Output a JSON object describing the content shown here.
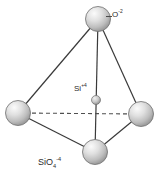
{
  "diagram": {
    "background_color": "#ffffff",
    "labels": {
      "oxygen": {
        "element": "O",
        "charge": "-2",
        "full": "O-2"
      },
      "silicon": {
        "element": "Si",
        "charge": "+4",
        "full": "Si+4"
      },
      "formula": {
        "element": "SiO",
        "subscript": "4",
        "charge": "-4",
        "full": "SiO4-4"
      }
    },
    "colors": {
      "sphere_fill_light": "#f2f2f2",
      "sphere_fill_mid": "#cfcfcf",
      "sphere_fill_dark": "#9a9a9a",
      "sphere_outline": "#6e6e6e",
      "bond_line": "#3a3a3a",
      "hidden_bond_line": "#4f4f4f",
      "text": "#2b2b2b"
    },
    "atoms": [
      {
        "id": "o-top",
        "element": "O",
        "cx": 98,
        "cy": 19,
        "r": 12.5,
        "role": "vertex"
      },
      {
        "id": "o-left",
        "element": "O",
        "cx": 18,
        "cy": 113,
        "r": 12.5,
        "role": "vertex"
      },
      {
        "id": "o-right",
        "element": "O",
        "cx": 141,
        "cy": 114,
        "r": 12.5,
        "role": "vertex"
      },
      {
        "id": "o-bottom",
        "element": "O",
        "cx": 95,
        "cy": 152,
        "r": 12.5,
        "role": "vertex"
      },
      {
        "id": "si-center",
        "element": "Si",
        "cx": 96,
        "cy": 100,
        "r": 4.5,
        "role": "center"
      }
    ],
    "bonds": [
      {
        "from": "o-top",
        "to": "o-left",
        "style": "solid"
      },
      {
        "from": "o-top",
        "to": "o-right",
        "style": "solid"
      },
      {
        "from": "o-top",
        "to": "o-bottom",
        "style": "solid"
      },
      {
        "from": "o-left",
        "to": "o-bottom",
        "style": "solid"
      },
      {
        "from": "o-right",
        "to": "o-bottom",
        "style": "solid"
      },
      {
        "from": "o-left",
        "to": "o-right",
        "style": "dashed"
      }
    ]
  }
}
